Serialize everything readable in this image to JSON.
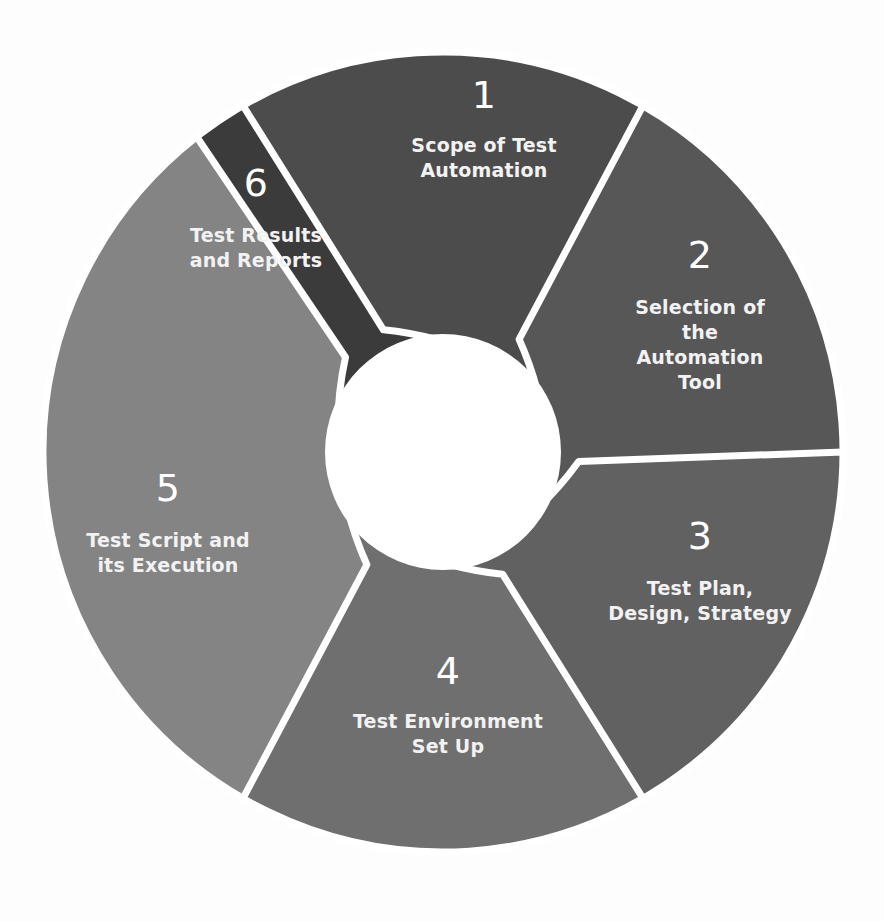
{
  "diagram": {
    "type": "circular-process-cycle",
    "background_color": "#fdfdfd",
    "separator_color": "#ffffff",
    "center_color": "#ffffff",
    "geometry": {
      "center_x": 443,
      "center_y": 452,
      "outer_radius": 400,
      "inner_radius": 118,
      "segment_count": 6
    },
    "segments": [
      {
        "number": "1",
        "label_lines": [
          "Scope of Test",
          "Automation"
        ],
        "color": "#3b3b3b",
        "num_x": 484,
        "num_y": 108,
        "text_x": 484,
        "text_y": 152,
        "start_angle": -90,
        "end_angle": -30
      },
      {
        "number": "2",
        "label_lines": [
          "Selection of",
          "the",
          "Automation",
          "Tool"
        ],
        "color": "#4c4c4c",
        "num_x": 700,
        "num_y": 268,
        "text_x": 700,
        "text_y": 314,
        "start_angle": -30,
        "end_angle": 30
      },
      {
        "number": "3",
        "label_lines": [
          "Test Plan,",
          "Design, Strategy"
        ],
        "color": "#575757",
        "num_x": 700,
        "num_y": 549,
        "text_x": 700,
        "text_y": 595,
        "start_angle": 30,
        "end_angle": 90
      },
      {
        "number": "4",
        "label_lines": [
          "Test Environment",
          "Set Up"
        ],
        "color": "#616161",
        "num_x": 448,
        "num_y": 684,
        "text_x": 448,
        "text_y": 728,
        "start_angle": 90,
        "end_angle": 150
      },
      {
        "number": "5",
        "label_lines": [
          "Test Script and",
          "its Execution"
        ],
        "color": "#6f6f6f",
        "num_x": 168,
        "num_y": 501,
        "text_x": 168,
        "text_y": 547,
        "start_angle": 150,
        "end_angle": 210
      },
      {
        "number": "6",
        "label_lines": [
          "Test Results",
          "and Reports"
        ],
        "color": "#848484",
        "num_x": 256,
        "num_y": 196,
        "text_x": 256,
        "text_y": 242,
        "start_angle": 210,
        "end_angle": 270
      }
    ]
  }
}
